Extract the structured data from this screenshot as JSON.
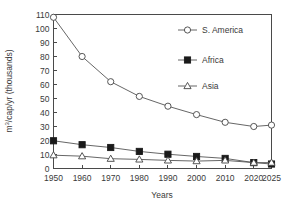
{
  "chart_data": {
    "type": "line",
    "title": "",
    "xlabel": "Years",
    "ylabel": "m³/cap/yr (thousands)",
    "ylabel_parts": {
      "prefix": "m",
      "superscript": "3",
      "suffix": "/cap/yr (thousands)"
    },
    "x": [
      1950,
      1960,
      1970,
      1980,
      1990,
      2000,
      2010,
      2020,
      2025
    ],
    "categories": [
      "1950",
      "1960",
      "1970",
      "1980",
      "1990",
      "2000",
      "2010",
      "2020",
      "2025"
    ],
    "xlim": [
      1950,
      2025
    ],
    "ylim": [
      0,
      110
    ],
    "yticks": [
      0,
      10,
      20,
      30,
      40,
      50,
      60,
      70,
      80,
      90,
      100,
      110
    ],
    "ytick_labels": [
      "0",
      "10",
      "20",
      "30",
      "40",
      "50",
      "60",
      "70",
      "80",
      "90",
      "100",
      "110"
    ],
    "grid": false,
    "legend_position": "inside-right",
    "series": [
      {
        "name": "S. America",
        "marker": "open-circle",
        "values": [
          108,
          80,
          62,
          51.5,
          44.5,
          38.5,
          33,
          30,
          31
        ]
      },
      {
        "name": "Africa",
        "marker": "filled-square",
        "values": [
          19.8,
          17,
          15,
          12.2,
          10.2,
          8.6,
          7.2,
          4.2,
          3.2
        ]
      },
      {
        "name": "Asia",
        "marker": "open-triangle",
        "values": [
          9.5,
          8.8,
          7,
          6.5,
          5.8,
          5.3,
          5.8,
          4.2,
          4.2
        ]
      }
    ],
    "colors": {
      "line": "#555555",
      "marker_fill_open": "#ffffff",
      "marker_fill_closed": "#1a1a1a",
      "axis": "#4a4a4a",
      "text": "#3a3a3a",
      "background": "#ffffff"
    }
  },
  "legend": {
    "entries": [
      {
        "label": "S. America",
        "marker": "open-circle"
      },
      {
        "label": "Africa",
        "marker": "filled-square"
      },
      {
        "label": "Asia",
        "marker": "open-triangle"
      }
    ]
  }
}
